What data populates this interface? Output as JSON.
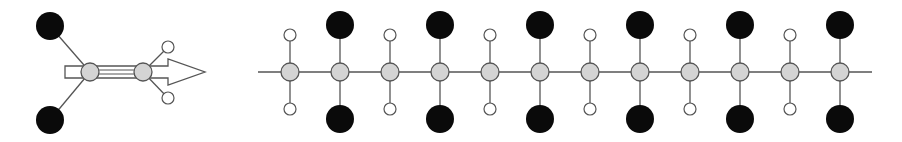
{
  "diagram": {
    "colors": {
      "background": "#ffffff",
      "bond": "#555555",
      "carbon_fill": "#d4d4d4",
      "carbon_stroke": "#555555",
      "substituent_fill": "#0a0a0a",
      "hydrogen_fill": "#ffffff",
      "hydrogen_stroke": "#555555",
      "arrow_fill": "#ffffff",
      "arrow_stroke": "#555555"
    },
    "monomer": {
      "carbons": [
        {
          "x": 90,
          "y": 72
        },
        {
          "x": 143,
          "y": 72
        }
      ],
      "substituents": [
        {
          "x": 50,
          "y": 26,
          "r": 14
        },
        {
          "x": 50,
          "y": 120,
          "r": 14
        }
      ],
      "hydrogens": [
        {
          "x": 168,
          "y": 47,
          "r": 6
        },
        {
          "x": 168,
          "y": 98,
          "r": 6
        }
      ],
      "arrow": {
        "x0": 65,
        "x1": 205,
        "y": 72
      }
    },
    "chain": {
      "y": 72,
      "x_start": 258,
      "x_end": 872,
      "carbon_x": [
        290,
        340,
        390,
        440,
        490,
        540,
        590,
        640,
        690,
        740,
        790,
        840
      ],
      "carbon_r": 9,
      "pattern": [
        "H",
        "X",
        "H",
        "X",
        "H",
        "X",
        "H",
        "X",
        "H",
        "X",
        "H",
        "X"
      ],
      "h_offset": 37,
      "h_r": 6,
      "x_offset": 47,
      "x_r": 14
    }
  }
}
